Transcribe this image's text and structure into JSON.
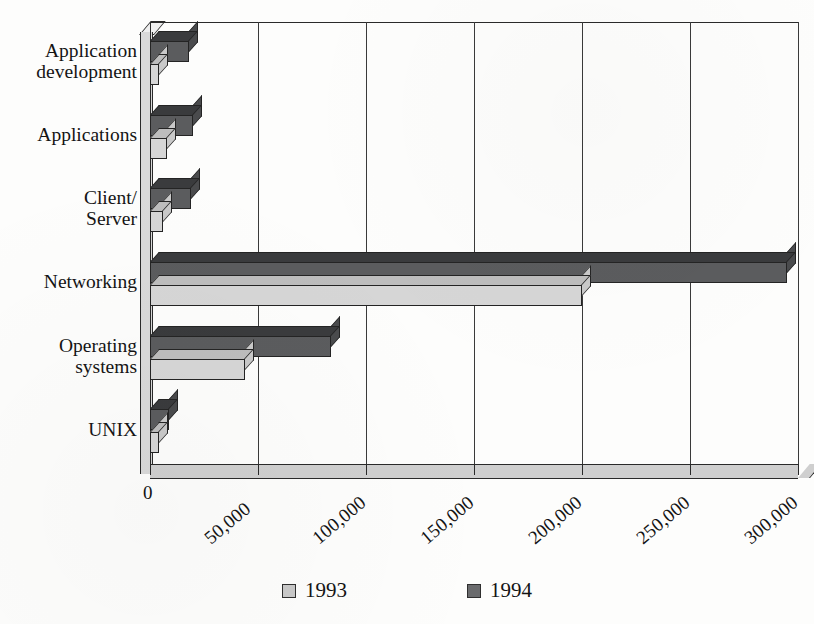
{
  "chart_data": {
    "type": "bar",
    "orientation": "horizontal",
    "title": "",
    "subtitle": "",
    "xlabel": "",
    "ylabel": "",
    "xlim": [
      0,
      300000
    ],
    "xticks": [
      0,
      50000,
      100000,
      150000,
      200000,
      250000,
      300000
    ],
    "xtick_labels": [
      "0",
      "50,000",
      "100,000",
      "150,000",
      "200,000",
      "250,000",
      "300,000"
    ],
    "grid": true,
    "grid_axis": "x",
    "legend_position": "bottom",
    "style": "3d-bar",
    "categories": [
      "Application\ndevelopment",
      "Applications",
      "Client/\nServer",
      "Networking",
      "Operating\nsystems",
      "UNIX"
    ],
    "category_labels": [
      "Application development",
      "Applications",
      "Client/Server",
      "Networking",
      "Operating systems",
      "UNIX"
    ],
    "series": [
      {
        "name": "1993",
        "color": "#d6d6d6",
        "values": [
          4000,
          8000,
          6000,
          200000,
          44000,
          4000
        ]
      },
      {
        "name": "1994",
        "color": "#5b5c5e",
        "values": [
          18000,
          20000,
          19000,
          295000,
          84000,
          9000
        ]
      }
    ]
  },
  "legend": {
    "entries": [
      {
        "label": "1993",
        "swatch": "legend-swatch-1993"
      },
      {
        "label": "1994",
        "swatch": "legend-swatch-1994"
      }
    ]
  },
  "axis": {
    "x_tick_labels": [
      "0",
      "50,000",
      "100,000",
      "150,000",
      "200,000",
      "250,000",
      "300,000"
    ],
    "y_tick_labels": [
      "Application\ndevelopment",
      "Applications",
      "Client/\nServer",
      "Networking",
      "Operating\nsystems",
      "UNIX"
    ]
  },
  "colors": {
    "series_1993": "#d6d6d6",
    "series_1994": "#5b5c5e",
    "axis": "#2a2a2a",
    "background": "#fdfdfc",
    "text": "#141414"
  }
}
